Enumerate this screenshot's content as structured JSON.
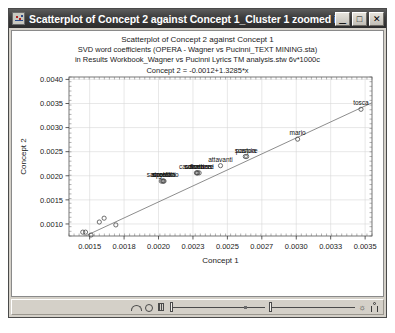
{
  "window": {
    "title": "Scatterplot of Concept 2 against Concept 1_Cluster 1 zoomed in...",
    "icon": "statistica-graph-icon",
    "minimize_label": "_",
    "maximize_label": "□",
    "close_label": "✕"
  },
  "chart_data": {
    "type": "scatter",
    "title": "Scatterplot of Concept 2 against Concept 1",
    "subtitle_line1": "SVD word coefficients (OPERA - Wagner vs Pucinni_TEXT MINING.sta)",
    "subtitle_line2": "in Results Workbook_Wagner vs Pucinni Lyrics TM analysis.stw 6v*1000c",
    "equation": "Concept 2 = -0.0012+1.3285*x",
    "xlabel": "Concept 1",
    "ylabel": "Concept 2",
    "xlim": [
      0.00135,
      0.00355
    ],
    "ylim": [
      0.00075,
      0.00405
    ],
    "xticks": [
      "0.0015",
      "0.0018",
      "0.0020",
      "0.0023",
      "0.0025",
      "0.0027",
      "0.0030",
      "0.0033",
      "0.0035"
    ],
    "xtick_values": [
      0.0015,
      0.00175,
      0.002,
      0.00225,
      0.0025,
      0.00275,
      0.003,
      0.00325,
      0.0035
    ],
    "yticks": [
      "0.0010",
      "0.0015",
      "0.0020",
      "0.0025",
      "0.0030",
      "0.0035",
      "0.0040"
    ],
    "ytick_values": [
      0.001,
      0.0015,
      0.002,
      0.0025,
      0.003,
      0.0035,
      0.004
    ],
    "grid": true,
    "legend": "none",
    "marker": "open-circle",
    "fit_line": {
      "intercept": -0.0012,
      "slope": 1.3285,
      "color": "#808080"
    },
    "points": [
      {
        "x": 0.00145,
        "y": 0.00083,
        "label": ""
      },
      {
        "x": 0.00147,
        "y": 0.00083,
        "label": ""
      },
      {
        "x": 0.00151,
        "y": 0.00077,
        "label": ""
      },
      {
        "x": 0.00157,
        "y": 0.00104,
        "label": ""
      },
      {
        "x": 0.001605,
        "y": 0.00112,
        "label": ""
      },
      {
        "x": 0.00169,
        "y": 0.00098,
        "label": ""
      },
      {
        "x": 0.00202,
        "y": 0.00189,
        "label": "ricordi"
      },
      {
        "x": 0.00203,
        "y": 0.00189,
        "label": "sacrestano"
      },
      {
        "x": 0.002035,
        "y": 0.00189,
        "label": "angelotti"
      },
      {
        "x": 0.00204,
        "y": 0.00189,
        "label": "spoletta"
      },
      {
        "x": 0.002275,
        "y": 0.00206,
        "label": "cavaradossi"
      },
      {
        "x": 0.00228,
        "y": 0.00206,
        "label": "floria"
      },
      {
        "x": 0.002285,
        "y": 0.00206,
        "label": "sciarrone"
      },
      {
        "x": 0.002295,
        "y": 0.00206,
        "label": "carceriere"
      },
      {
        "x": 0.00245,
        "y": 0.00221,
        "label": "attavanti"
      },
      {
        "x": 0.00263,
        "y": 0.0024,
        "label": "scarpia"
      },
      {
        "x": 0.00264,
        "y": 0.0024,
        "label": "pastore"
      },
      {
        "x": 0.00301,
        "y": 0.00276,
        "label": "mario"
      },
      {
        "x": 0.00347,
        "y": 0.00338,
        "label": "tosca"
      }
    ]
  },
  "toolbar": {
    "arc_icon": "arc-tool-icon",
    "circle_icon": "circle-tool-icon",
    "grid_icon": "grid-tool-icon",
    "slider_left": "zoom-slider",
    "slider_right": "scale-slider",
    "zoom_out_icon": "zoom-out-icon",
    "person_icon": "person-icon"
  }
}
